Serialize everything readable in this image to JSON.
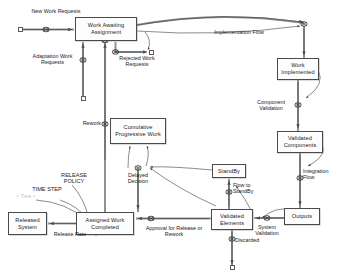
{
  "diagram": {
    "stocks": [
      {
        "id": "work_awaiting_assignment",
        "label": "Work Awaiting Assignment",
        "x": 75,
        "y": 17,
        "w": 62,
        "h": 24
      },
      {
        "id": "cumulative_progressive_work",
        "label": "Cumulative Progressive Work",
        "x": 110,
        "y": 118,
        "w": 56,
        "h": 26
      },
      {
        "id": "assigned_work_completed",
        "label": "Assigned Work Completed",
        "x": 76,
        "y": 212,
        "w": 58,
        "h": 23
      },
      {
        "id": "released_system",
        "label": "Released System",
        "x": 8,
        "y": 212,
        "w": 39,
        "h": 23
      },
      {
        "id": "work_implemented",
        "label": "Work Implemented",
        "x": 277,
        "y": 58,
        "w": 42,
        "h": 22
      },
      {
        "id": "validated_components",
        "label": "Validated Components",
        "x": 277,
        "y": 131,
        "w": 46,
        "h": 22
      },
      {
        "id": "standby",
        "label": "StandBy",
        "x": 212,
        "y": 164,
        "w": 34,
        "h": 14
      },
      {
        "id": "validated_elements",
        "label": "Validated Elements",
        "x": 211,
        "y": 209,
        "w": 42,
        "h": 21
      },
      {
        "id": "outputs",
        "label": "Outputs",
        "x": 284,
        "y": 208,
        "w": 36,
        "h": 17
      }
    ],
    "flows": [
      {
        "id": "new_work_requests",
        "label": "New Work Requests",
        "x": 31,
        "y": 8,
        "w": 50
      },
      {
        "id": "adaptation_work_requests",
        "label": "Adaptation Work Requests",
        "x": 25,
        "y": 53,
        "w": 58
      },
      {
        "id": "rejected_work_requests",
        "label": "Rejected Work Requests",
        "x": 113,
        "y": 55,
        "w": 50
      },
      {
        "id": "implementation_flow",
        "label": "Implementation Flow",
        "x": 208,
        "y": 29,
        "w": 62
      },
      {
        "id": "component_validation",
        "label": "Component Validation",
        "x": 247,
        "y": 99,
        "w": 46
      },
      {
        "id": "integration_flow",
        "label": "Integration Flow",
        "x": 297,
        "y": 168,
        "w": 40
      },
      {
        "id": "system_validation",
        "label": "System Validation",
        "x": 246,
        "y": 224,
        "w": 42
      },
      {
        "id": "flow_to_standby",
        "label": "Flow to StandBy",
        "x": 225,
        "y": 185,
        "w": 40
      },
      {
        "id": "discarded",
        "label": "Discarded",
        "x": 176,
        "y": 239,
        "w": 32
      },
      {
        "id": "approval_release_rework",
        "label": "Approval for Release or Rework",
        "x": 145,
        "y": 225,
        "w": 62
      },
      {
        "id": "release_rate",
        "label": "Release Rate",
        "x": 36,
        "y": 232,
        "w": 40
      },
      {
        "id": "rework",
        "label": "Rework",
        "x": 67,
        "y": 120,
        "w": 26
      },
      {
        "id": "delayed_decision",
        "label": "Delayed Decision",
        "x": 117,
        "y": 169,
        "w": 38
      }
    ],
    "auxiliaries": [
      {
        "id": "time_step",
        "label": "TIME STEP",
        "x": 21,
        "y": 187,
        "w": 46
      },
      {
        "id": "release_policy",
        "label": "RELEASE POLICY",
        "x": 50,
        "y": 173,
        "w": 42
      },
      {
        "id": "faint_note",
        "label": "< Time >",
        "x": 12,
        "y": 194,
        "w": 30
      }
    ],
    "colors": {
      "stroke": "#6b6b6b",
      "box_border": "#4a4a4a",
      "text": "#1b1b1b",
      "background": "#ffffff",
      "faint_text": "#b9b9b9"
    }
  }
}
